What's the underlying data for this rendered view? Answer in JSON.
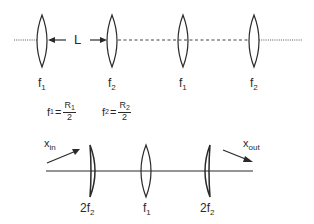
{
  "diagram": {
    "top_row": {
      "gap_label": "L",
      "lenses": [
        {
          "name": "f",
          "sub": "1",
          "x": 42
        },
        {
          "name": "f",
          "sub": "2",
          "x": 112
        },
        {
          "name": "f",
          "sub": "1",
          "x": 183
        },
        {
          "name": "f",
          "sub": "2",
          "x": 254
        }
      ],
      "formulas": [
        {
          "lhs": "f",
          "lhs_sub": "1",
          "eq": "=",
          "num": "R",
          "num_sub": "1",
          "den": "2"
        },
        {
          "lhs": "f",
          "lhs_sub": "2",
          "eq": "=",
          "num": "R",
          "num_sub": "2",
          "den": "2"
        }
      ]
    },
    "bottom_row": {
      "input_label": "x",
      "input_sub": "in",
      "output_label": "x",
      "output_sub": "out",
      "lenses": [
        {
          "prefix": "2",
          "name": "f",
          "sub": "2",
          "x": 92
        },
        {
          "prefix": "",
          "name": "f",
          "sub": "1",
          "x": 146
        },
        {
          "prefix": "2",
          "name": "f",
          "sub": "2",
          "x": 208
        }
      ]
    },
    "colors": {
      "ink": "#2a2a2a",
      "background": "#ffffff"
    }
  }
}
